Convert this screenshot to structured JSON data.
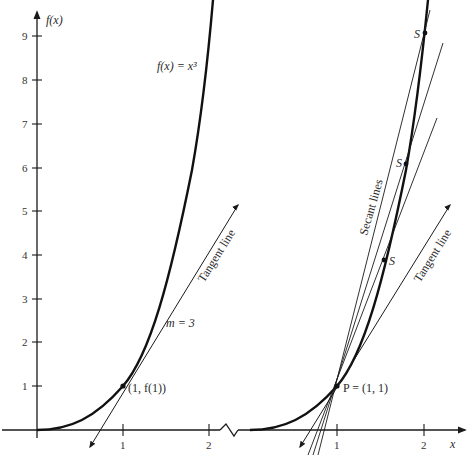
{
  "figure": {
    "left_panel": {
      "y_axis_label": "f(x)",
      "function_label": "f(x) = x³",
      "point_label": "(1, f(1))",
      "tangent_label": "Tangent line",
      "slope_label": "m = 3",
      "y_ticks": [
        "1",
        "2",
        "3",
        "4",
        "5",
        "6",
        "7",
        "8",
        "9"
      ],
      "x_ticks": [
        "1",
        "2"
      ]
    },
    "right_panel": {
      "point_label": "P = (1, 1)",
      "secant_label": "Secant lines",
      "tangent_label": "Tangent line",
      "secant_points": [
        "S",
        "S",
        "S"
      ],
      "x_ticks": [
        "1",
        "2"
      ],
      "x_axis_label": "x"
    },
    "colors": {
      "ink": "#1a1a1a",
      "background": "#ffffff"
    }
  }
}
